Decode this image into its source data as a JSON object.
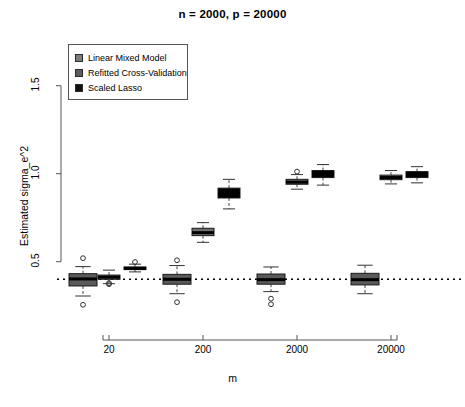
{
  "chart_data": {
    "type": "box",
    "title": "n = 2000, p = 20000",
    "xlabel": "m",
    "ylabel": "Estimated sigma_e^2",
    "ylim": [
      0.18,
      1.72
    ],
    "yticks": [
      0.5,
      1.0,
      1.5
    ],
    "ytick_labels": [
      "0.5",
      "1.0",
      "1.5"
    ],
    "categories": [
      "20",
      "200",
      "2000",
      "20000"
    ],
    "grid": false,
    "legend_position": "top-left",
    "reference_line": {
      "value": 0.4,
      "style": "dotted",
      "label": "true sigma_e^2 = 0.4"
    },
    "series": [
      {
        "name": "Linear Mixed Model",
        "color": "#5a5a5a",
        "boxes": [
          {
            "category": "20",
            "min": 0.305,
            "q1": 0.362,
            "median": 0.402,
            "q3": 0.432,
            "max": 0.472,
            "outliers": [
              0.52,
              0.255
            ]
          },
          {
            "category": "200",
            "min": 0.318,
            "q1": 0.372,
            "median": 0.4,
            "q3": 0.428,
            "max": 0.478,
            "outliers": [
              0.508,
              0.27
            ]
          },
          {
            "category": "2000",
            "min": 0.33,
            "q1": 0.372,
            "median": 0.398,
            "q3": 0.43,
            "max": 0.47,
            "outliers": [
              0.29,
              0.258
            ]
          },
          {
            "category": "20000",
            "min": 0.318,
            "q1": 0.368,
            "median": 0.398,
            "q3": 0.434,
            "max": 0.48,
            "outliers": []
          }
        ]
      },
      {
        "name": "Refitted Cross-Validation",
        "color": "#6e6e6e",
        "boxes": [
          {
            "category": "20",
            "min": 0.375,
            "q1": 0.4,
            "median": 0.412,
            "q3": 0.424,
            "max": 0.452,
            "outliers": [
              0.378,
              0.372
            ]
          },
          {
            "category": "200",
            "min": 0.61,
            "q1": 0.648,
            "median": 0.665,
            "q3": 0.69,
            "max": 0.722,
            "outliers": []
          },
          {
            "category": "2000",
            "min": 0.912,
            "q1": 0.94,
            "median": 0.952,
            "q3": 0.968,
            "max": 0.995,
            "outliers": [
              1.012
            ]
          },
          {
            "category": "20000",
            "min": 0.942,
            "q1": 0.966,
            "median": 0.978,
            "q3": 0.992,
            "max": 1.018,
            "outliers": []
          }
        ]
      },
      {
        "name": "Scaled Lasso",
        "color": "#000000",
        "boxes": [
          {
            "category": "20",
            "min": 0.442,
            "q1": 0.455,
            "median": 0.462,
            "q3": 0.47,
            "max": 0.486,
            "outliers": [
              0.498
            ]
          },
          {
            "category": "200",
            "min": 0.8,
            "q1": 0.862,
            "median": 0.888,
            "q3": 0.918,
            "max": 0.968,
            "outliers": []
          },
          {
            "category": "2000",
            "min": 0.935,
            "q1": 0.978,
            "median": 0.998,
            "q3": 1.018,
            "max": 1.052,
            "outliers": []
          },
          {
            "category": "20000",
            "min": 0.948,
            "q1": 0.978,
            "median": 0.996,
            "q3": 1.012,
            "max": 1.04,
            "outliers": []
          }
        ]
      }
    ]
  },
  "legend": {
    "items": [
      {
        "label": "Linear Mixed Model",
        "color": "#7c7c7c"
      },
      {
        "label": "Refitted Cross-Validation",
        "color": "#5c5c5c"
      },
      {
        "label": "Scaled Lasso",
        "color": "#111111"
      }
    ]
  }
}
